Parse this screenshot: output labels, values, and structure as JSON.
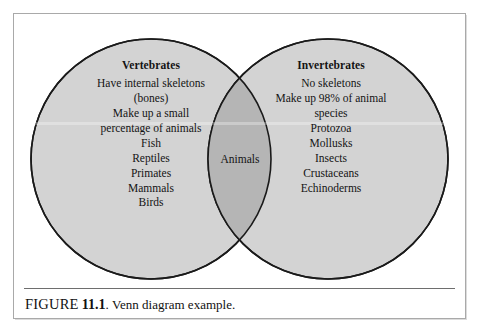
{
  "figure": {
    "caption": {
      "figure_word": "FIGURE",
      "number": "11.1",
      "separator": ".",
      "text": "Venn diagram example."
    }
  },
  "diagram": {
    "type": "venn",
    "sets": [
      {
        "id": "vertebrates",
        "title": "Vertebrates",
        "lines": [
          "Have internal skeletons",
          "(bones)",
          "Make up a small",
          "percentage of animals",
          "Fish",
          "Reptiles",
          "Primates",
          "Mammals",
          "Birds"
        ]
      },
      {
        "id": "invertebrates",
        "title": "Invertebrates",
        "lines": [
          "No skeletons",
          "Make up 98% of animal",
          "species",
          "Protozoa",
          "Mollusks",
          "Insects",
          "Crustaceans",
          "Echinoderms"
        ]
      }
    ],
    "intersection": {
      "label": "Animals"
    },
    "colors": {
      "circle_fill": "#d3d3d3",
      "intersection_fill": "#b5b5b5",
      "circle_stroke": "#1a1a1a",
      "page_background": "#ffffff",
      "frame_border": "#a9a9a9",
      "caption_rule": "#6e6e6e",
      "text": "#141414"
    }
  }
}
